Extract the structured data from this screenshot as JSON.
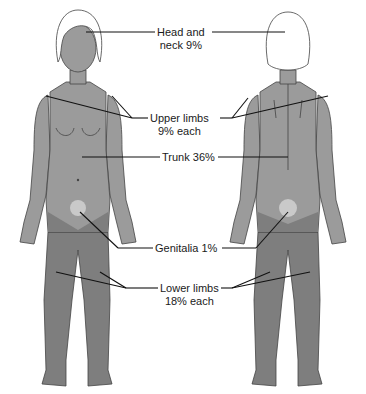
{
  "diagram": {
    "type": "body-surface-area-rule-of-nines",
    "views": [
      "front",
      "back"
    ],
    "labels": [
      {
        "id": "head",
        "line1": "Head and",
        "line2": "neck 9%"
      },
      {
        "id": "upper",
        "line1": "Upper limbs",
        "line2": "9% each"
      },
      {
        "id": "trunk",
        "line1": "Trunk 36%",
        "line2": ""
      },
      {
        "id": "genitalia",
        "line1": "Genitalia 1%",
        "line2": ""
      },
      {
        "id": "lower",
        "line1": "Lower limbs",
        "line2": "18% each"
      }
    ],
    "colors": {
      "upper_body": "#9b9b9b",
      "lower_limbs": "#7e7e7e",
      "genitalia": "#c9c9c9",
      "hair": "#ffffff",
      "outline": "#444444",
      "leader_lines": "#111111"
    }
  }
}
